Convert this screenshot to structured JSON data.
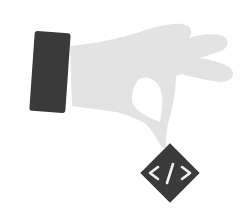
{
  "illustration": {
    "description": "Hand pinching a code tag badge",
    "colors": {
      "hand": "#e3e3e3",
      "cuff": "#3a3a3a",
      "badge": "#3a3a3a",
      "glyph": "#f2f2f2",
      "background": "#ffffff"
    },
    "badge": {
      "icon": "code-icon",
      "glyph_text": "</>"
    }
  }
}
